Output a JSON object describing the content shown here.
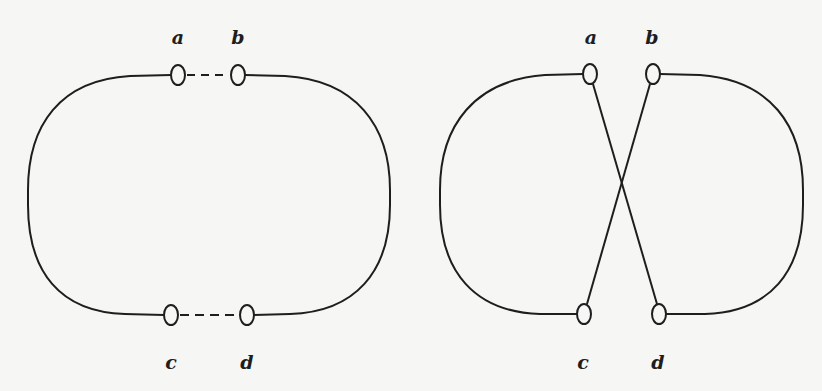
{
  "diagrams": [
    {
      "id": "left",
      "description": "Two arcs joined by dashed connections a–b (top) and c–d (bottom)",
      "labels": {
        "a": "a",
        "b": "b",
        "c": "c",
        "d": "d"
      },
      "connections": [
        {
          "from": "a",
          "to": "b",
          "style": "dashed"
        },
        {
          "from": "c",
          "to": "d",
          "style": "dashed"
        },
        {
          "from": "a",
          "to": "c",
          "style": "solid-arc-left"
        },
        {
          "from": "b",
          "to": "d",
          "style": "solid-arc-right"
        }
      ]
    },
    {
      "id": "right",
      "description": "Two arcs with crossing straight segments a–d and b–c",
      "labels": {
        "a": "a",
        "b": "b",
        "c": "c",
        "d": "d"
      },
      "connections": [
        {
          "from": "a",
          "to": "d",
          "style": "solid-straight"
        },
        {
          "from": "b",
          "to": "c",
          "style": "solid-straight"
        },
        {
          "from": "a",
          "to": "c",
          "style": "solid-arc-left"
        },
        {
          "from": "b",
          "to": "d",
          "style": "solid-arc-right"
        }
      ]
    }
  ],
  "colors": {
    "stroke": "#1e1e1e",
    "background": "#f6f6f4",
    "node_fill": "#f6f6f4"
  }
}
